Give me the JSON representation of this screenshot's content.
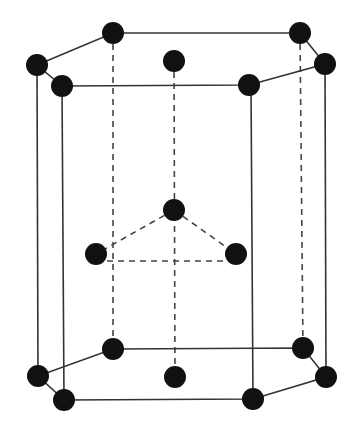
{
  "diagram": {
    "colors": {
      "atom": "#111111",
      "line": "#333333",
      "background": "#ffffff"
    },
    "atom_radius": 11,
    "atoms": {
      "top_layer": [
        {
          "id": "t-back-left",
          "x": 113,
          "y": 33
        },
        {
          "id": "t-back-right",
          "x": 300,
          "y": 33
        },
        {
          "id": "t-left",
          "x": 37,
          "y": 65
        },
        {
          "id": "t-right",
          "x": 325,
          "y": 64
        },
        {
          "id": "t-front-left",
          "x": 62,
          "y": 86
        },
        {
          "id": "t-front-right",
          "x": 249,
          "y": 85
        },
        {
          "id": "t-center",
          "x": 174,
          "y": 61
        }
      ],
      "middle_layer": [
        {
          "id": "m-back",
          "x": 174,
          "y": 210
        },
        {
          "id": "m-left",
          "x": 96,
          "y": 254
        },
        {
          "id": "m-right",
          "x": 236,
          "y": 254
        }
      ],
      "bottom_layer": [
        {
          "id": "b-back-left",
          "x": 113,
          "y": 349
        },
        {
          "id": "b-back-right",
          "x": 303,
          "y": 348
        },
        {
          "id": "b-left",
          "x": 38,
          "y": 376
        },
        {
          "id": "b-right",
          "x": 326,
          "y": 377
        },
        {
          "id": "b-front-left",
          "x": 64,
          "y": 400
        },
        {
          "id": "b-front-right",
          "x": 253,
          "y": 399
        },
        {
          "id": "b-center",
          "x": 175,
          "y": 377
        }
      ]
    }
  }
}
